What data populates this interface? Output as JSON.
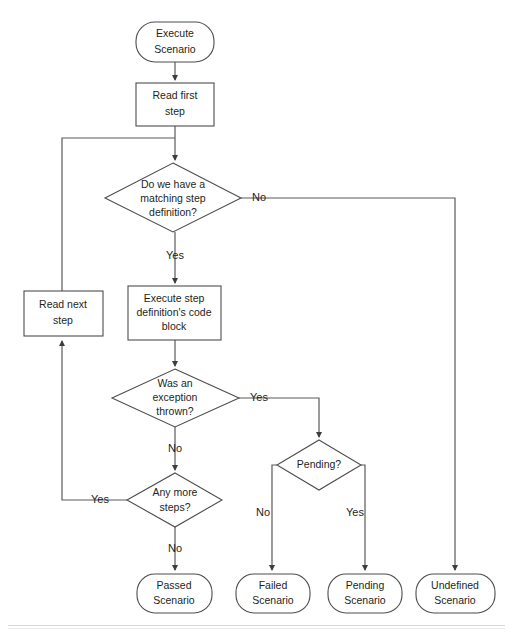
{
  "diagram": {
    "colors": {
      "stroke": "#4d4d4d",
      "edge": "#5a5a5a",
      "text": "#231f20",
      "background": "#ffffff"
    },
    "nodes": {
      "execute_scenario": {
        "line1": "Execute",
        "line2": "Scenario",
        "shape": "rounded-terminal"
      },
      "read_first_step": {
        "line1": "Read first",
        "line2": "step",
        "shape": "process"
      },
      "matching_step_definition": {
        "line1": "Do we have a",
        "line2": "matching step",
        "line3": "definition?",
        "shape": "decision"
      },
      "read_next_step": {
        "line1": "Read next",
        "line2": "step",
        "shape": "process"
      },
      "execute_step_definition": {
        "line1": "Execute step",
        "line2": "definition's code",
        "line3": "block",
        "shape": "process"
      },
      "exception_thrown": {
        "line1": "Was an",
        "line2": "exception",
        "line3": "thrown?",
        "shape": "decision"
      },
      "pending": {
        "line1": "Pending?",
        "shape": "decision"
      },
      "any_more_steps": {
        "line1": "Any more",
        "line2": "steps?",
        "shape": "decision"
      },
      "passed_scenario": {
        "line1": "Passed",
        "line2": "Scenario",
        "shape": "rounded-terminal"
      },
      "failed_scenario": {
        "line1": "Failed",
        "line2": "Scenario",
        "shape": "rounded-terminal"
      },
      "pending_scenario": {
        "line1": "Pending",
        "line2": "Scenario",
        "shape": "rounded-terminal"
      },
      "undefined_scenario": {
        "line1": "Undefined",
        "line2": "Scenario",
        "shape": "rounded-terminal"
      }
    },
    "edge_labels": {
      "matching_no": "No",
      "matching_yes": "Yes",
      "exception_yes": "Yes",
      "exception_no": "No",
      "pending_no": "No",
      "pending_yes": "Yes",
      "any_more_yes": "Yes",
      "any_more_no": "No"
    }
  }
}
